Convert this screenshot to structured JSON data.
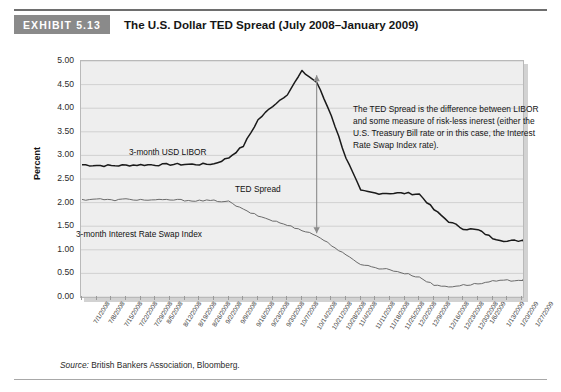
{
  "header": {
    "badge": "EXHIBIT 5.13",
    "title": "The U.S. Dollar TED Spread (July 2008–January 2009)"
  },
  "source": {
    "prefix": "Source:",
    "text": "British Bankers Association, Bloomberg."
  },
  "annotation": {
    "text": "The TED Spread is the difference between LIBOR and some measure of risk-less inerest (either the U.S. Treasury Bill rate or in this case, the Interest Rate Swap Index rate)."
  },
  "labels": {
    "libor": "3-month USD LIBOR",
    "swap": "3-month Interest Rate Swap Index",
    "ted": "TED Spread"
  },
  "colors": {
    "badge": "#8a8a8a",
    "plot_bg": "#eeeeee",
    "grid": "#c9c9c9",
    "libor_line": "#1a1a1a",
    "swap_line": "#6b6b6b",
    "arrow": "#8c8c8c"
  },
  "chart_data": {
    "type": "line",
    "title": "The U.S. Dollar TED Spread (July 2008–January 2009)",
    "xlabel": "",
    "ylabel": "Percent",
    "ylim": [
      0.0,
      5.0
    ],
    "yticks": [
      "0.00",
      "0.50",
      "1.00",
      "1.50",
      "2.00",
      "2.50",
      "3.00",
      "3.50",
      "4.00",
      "4.50",
      "5.00"
    ],
    "grid": true,
    "legend": "inline-labels",
    "annotations": [
      {
        "text": "3-month USD LIBOR",
        "x": "8/12/2008",
        "y": 3.15
      },
      {
        "text": "3-month Interest Rate Swap Index",
        "x": "9/9/2008",
        "y": 1.35
      },
      {
        "text": "TED Spread",
        "x": "10/14/2008",
        "y": 1.95,
        "arrow": "vertical double arrow from 4.75 to 1.45 at 10/21/2008"
      }
    ],
    "categories": [
      "7/1/2008",
      "7/8/2008",
      "7/15/2008",
      "7/22/2008",
      "7/29/2008",
      "8/5/2008",
      "8/12/2008",
      "8/19/2008",
      "8/26/2008",
      "9/2/2008",
      "9/9/2008",
      "9/16/2008",
      "9/23/2008",
      "9/30/2008",
      "10/7/2008",
      "10/14/2008",
      "10/21/2008",
      "10/28/2008",
      "11/4/2008",
      "11/11/2008",
      "11/18/2008",
      "11/25/2008",
      "12/2/2008",
      "12/9/2008",
      "12/16/2008",
      "12/23/2008",
      "12/30/2008",
      "1/6/2009",
      "1/13/2009",
      "1/20/2009",
      "1/27/2009"
    ],
    "series": [
      {
        "name": "3-month USD LIBOR",
        "color": "#1a1a1a",
        "values": [
          2.8,
          2.79,
          2.78,
          2.79,
          2.8,
          2.8,
          2.81,
          2.81,
          2.81,
          2.82,
          2.95,
          3.2,
          3.75,
          4.05,
          4.3,
          4.78,
          4.55,
          3.85,
          2.95,
          2.25,
          2.2,
          2.2,
          2.2,
          2.18,
          1.85,
          1.6,
          1.45,
          1.42,
          1.25,
          1.18,
          1.2
        ]
      },
      {
        "name": "3-month Interest Rate Swap Index",
        "color": "#6b6b6b",
        "values": [
          2.06,
          2.08,
          2.05,
          2.07,
          2.06,
          2.05,
          2.06,
          2.05,
          2.04,
          2.04,
          2.02,
          1.85,
          1.72,
          1.62,
          1.52,
          1.42,
          1.3,
          1.1,
          0.88,
          0.7,
          0.62,
          0.58,
          0.5,
          0.42,
          0.25,
          0.22,
          0.25,
          0.28,
          0.33,
          0.35,
          0.36
        ]
      }
    ]
  }
}
